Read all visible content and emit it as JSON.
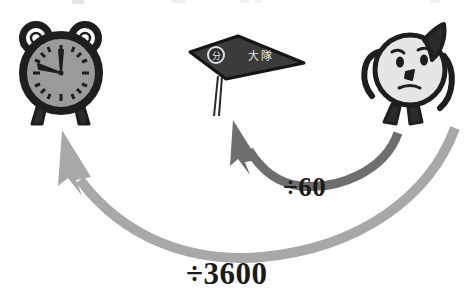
{
  "figure": {
    "type": "conversion-diagram",
    "background_color": "#ffffff",
    "width": 470,
    "height": 306
  },
  "nodes": [
    {
      "id": "clock",
      "name": "alarm-clock-character",
      "role": "target-unit",
      "description": "cartoon alarm clock with two bells, gray dial, two legs",
      "face_color": "#9a9a9a",
      "outline_color": "#1e1e1e",
      "position": {
        "x": 14,
        "y": 24,
        "w": 95,
        "h": 106
      }
    },
    {
      "id": "banner",
      "name": "minute-banner",
      "role": "intermediate-unit",
      "emblem_text": "分",
      "label_text": "大隊",
      "banner_color": "#3b3b3b",
      "text_color": "#e8e8e8",
      "position": {
        "x": 186,
        "y": 36,
        "w": 120,
        "h": 78
      }
    },
    {
      "id": "face",
      "name": "round-face-character",
      "role": "source-unit",
      "description": "round cartoon head with dark pointed ear, raised arm and two legs",
      "head_color": "#e6e6e6",
      "ear_color": "#2a2a2a",
      "outline_color": "#1e1e1e",
      "position": {
        "x": 362,
        "y": 22,
        "w": 96,
        "h": 110
      }
    }
  ],
  "arrows": [
    {
      "id": "arrow-60",
      "name": "divide-by-60-arrow",
      "from": "face",
      "to": "banner",
      "label": "÷60",
      "color": "#6e6e6e",
      "style": "curved-thick"
    },
    {
      "id": "arrow-3600",
      "name": "divide-by-3600-arrow",
      "from": "face",
      "to": "clock",
      "label": "÷3600",
      "color": "#a8a8a8",
      "style": "curved-thick-sweeping"
    }
  ],
  "labels": {
    "divide_60": "÷60",
    "divide_3600": "÷3600",
    "banner_emblem": "分",
    "banner_text": "大隊"
  },
  "colors": {
    "background": "#ffffff",
    "ink": "#1e1e1e",
    "clock_face": "#9a9a9a",
    "banner": "#3b3b3b",
    "head": "#e6e6e6",
    "arrow_dark": "#6e6e6e",
    "arrow_light": "#a8a8a8",
    "text": "#1a1a1a"
  }
}
